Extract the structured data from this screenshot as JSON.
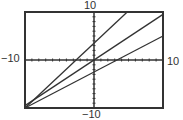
{
  "chart_data": {
    "type": "line",
    "title": "",
    "xlabel": "",
    "ylabel": "",
    "xlim": [
      -10,
      10
    ],
    "ylim": [
      -10,
      10
    ],
    "xscale": 1,
    "yscale": 1,
    "grid": false,
    "axes_tick_marks": true,
    "window_labels": {
      "xmin": "−10",
      "xmax": "10",
      "ymin": "−10",
      "ymax": "10"
    },
    "series": [
      {
        "name": "line-steep",
        "slope": 1.35,
        "intercept": 3.5,
        "points": [
          [
            -10,
            -10
          ],
          [
            4.8,
            10
          ]
        ]
      },
      {
        "name": "line-middle",
        "slope": 0.95,
        "intercept": 0,
        "points": [
          [
            -10,
            -9.5
          ],
          [
            10,
            9.5
          ]
        ]
      },
      {
        "name": "line-shallow",
        "slope": 0.75,
        "intercept": -2.5,
        "points": [
          [
            -10,
            -10
          ],
          [
            10,
            5
          ]
        ]
      }
    ],
    "colors": {
      "line": "#333333",
      "frame": "#333333",
      "background": "#ffffff"
    }
  }
}
